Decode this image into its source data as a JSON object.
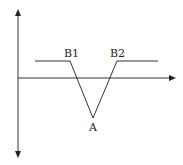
{
  "diagram": {
    "labels": {
      "b1": "B1",
      "b2": "B2",
      "a": "A"
    },
    "colors": {
      "stroke": "#333333",
      "text": "#222222",
      "background": "#ffffff"
    },
    "points": {
      "left_start": [
        35,
        61
      ],
      "b1_corner": [
        70,
        61
      ],
      "a_vertex": [
        93,
        118
      ],
      "b2_corner": [
        117,
        61
      ],
      "right_end": [
        158,
        61
      ]
    },
    "axes": {
      "vertical": {
        "x": 18,
        "y_top": 10,
        "y_bottom": 157,
        "arrows": "both"
      },
      "horizontal": {
        "y": 78,
        "x_start": 18,
        "x_end": 175,
        "arrows": "right"
      }
    }
  }
}
